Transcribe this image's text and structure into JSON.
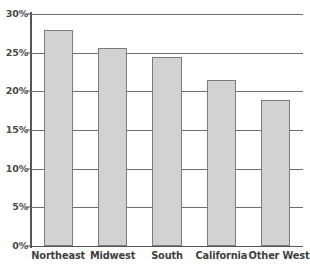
{
  "chart_data": {
    "type": "bar",
    "title": "",
    "xlabel": "",
    "ylabel": "",
    "categories": [
      "Northeast",
      "Midwest",
      "South",
      "California",
      "Other West"
    ],
    "values": [
      27.9,
      25.6,
      24.4,
      21.5,
      18.9
    ],
    "value_labels": [
      "27.9%",
      "25.6%",
      "24.4%",
      "21.5%",
      "18.9%"
    ],
    "ylim": [
      0,
      30
    ],
    "ytick_values": [
      0,
      5,
      10,
      15,
      20,
      25,
      30
    ],
    "ytick_labels": [
      "0%",
      "5%",
      "10%",
      "15%",
      "20%",
      "25%",
      "30%"
    ],
    "grid": "horizontal",
    "legend": "none",
    "series": [
      {
        "name": "",
        "values": [
          27.9,
          25.6,
          24.4,
          21.5,
          18.9
        ]
      }
    ],
    "colors": {
      "bar_fill": "#d2d2d2",
      "bar_border": "#7c7c7c",
      "gridline": "#6e6e6e",
      "axis": "#555555",
      "tick_label": "#4a4a4a",
      "category_label": "#3f3f3f",
      "background": "#ffffff"
    }
  }
}
